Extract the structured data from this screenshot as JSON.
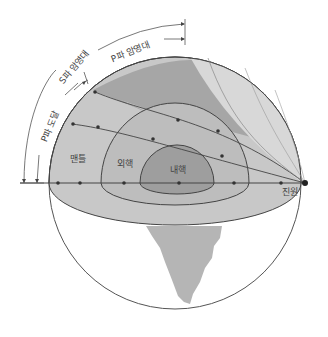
{
  "diagram": {
    "layers": {
      "mantle": "맨틀",
      "outer_core": "외핵",
      "inner_core": "내핵"
    },
    "focus_label": "진원",
    "zones": {
      "p_arrival": "P파 도달",
      "s_shadow": "S파 암영대",
      "p_shadow": "P파 암영대"
    },
    "colors": {
      "mantle": "#c8c8c8",
      "shadow_dark": "#a6a6a6",
      "shadow_light": "#d8d8d8",
      "outer_core": "#bdbdbd",
      "inner_core": "#9e9e9e",
      "cone": "#b5b5b5",
      "line": "#444444"
    }
  }
}
